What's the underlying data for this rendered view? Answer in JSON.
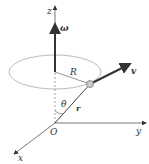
{
  "diagram": {
    "type": "3d-rotation-kinematics",
    "labels": {
      "z_axis": "z",
      "y_axis": "y",
      "x_axis": "x",
      "origin": "O",
      "angular_velocity": "ω",
      "radius": "R",
      "velocity": "v",
      "position": "r",
      "angle": "θ"
    },
    "colors": {
      "axis": "#555555",
      "vector": "#333333",
      "circle": "#999999",
      "particle_fill": "#cccccc",
      "particle_stroke": "#777777",
      "text": "#333333"
    }
  }
}
